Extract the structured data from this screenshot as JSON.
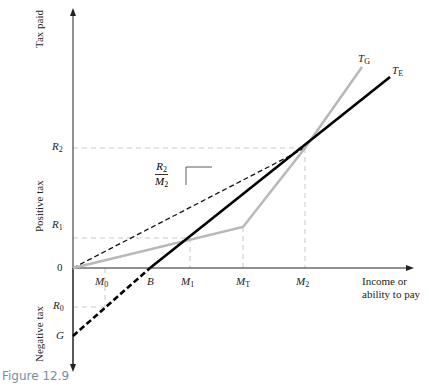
{
  "figure": {
    "caption": "Figure 12.9",
    "caption_color": "#7a8ea0"
  },
  "axes": {
    "y_top_label": "Tax paid",
    "y_positive_label": "Positive tax",
    "y_negative_label": "Negative tax",
    "x_label_line1": "Income or",
    "x_label_line2": "ability to pay"
  },
  "y_ticks": [
    {
      "base": "R",
      "sub": "2"
    },
    {
      "base": "R",
      "sub": "1"
    },
    {
      "base": "0",
      "sub": ""
    },
    {
      "base": "R",
      "sub": "0"
    },
    {
      "base": "G",
      "sub": ""
    }
  ],
  "x_ticks": [
    {
      "base": "M",
      "sub": "0"
    },
    {
      "base": "B",
      "sub": ""
    },
    {
      "base": "M",
      "sub": "1"
    },
    {
      "base": "M",
      "sub": "T"
    },
    {
      "base": "M",
      "sub": "2"
    }
  ],
  "curves": {
    "tg": {
      "base": "T",
      "sub": "G",
      "color": "#b8b8b8"
    },
    "te": {
      "base": "T",
      "sub": "E",
      "color": "#000000"
    }
  },
  "slope_label": {
    "num_base": "R",
    "num_sub": "2",
    "den_base": "M",
    "den_sub": "2"
  }
}
